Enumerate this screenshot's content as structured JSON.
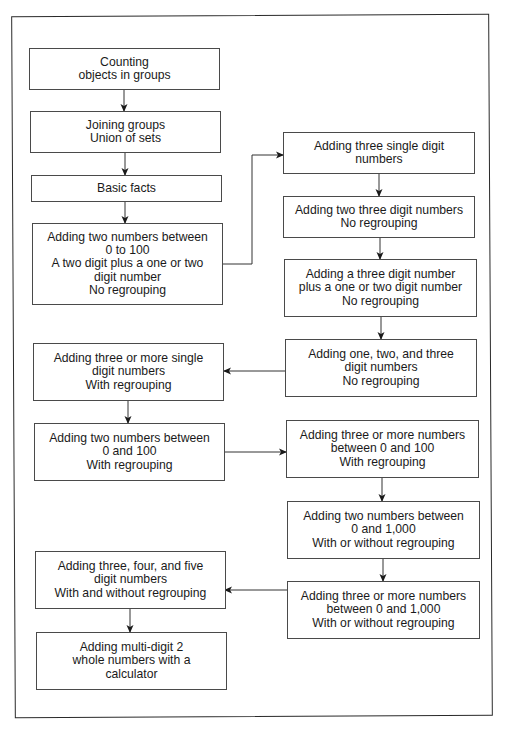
{
  "diagram": {
    "type": "flowchart",
    "title": "",
    "left_column": [
      {
        "id": "counting",
        "lines": [
          "Counting",
          "objects in groups"
        ]
      },
      {
        "id": "joining",
        "lines": [
          "Joining groups",
          "Union of sets"
        ]
      },
      {
        "id": "basic-facts",
        "lines": [
          "Basic facts"
        ]
      },
      {
        "id": "two-numbers-0-100-no-regroup",
        "lines": [
          "Adding two numbers between",
          "0 to 100",
          "A two digit plus a one or two",
          "digit number",
          "No regrouping"
        ]
      },
      {
        "id": "three-or-more-single-regroup",
        "lines": [
          "Adding three or more single",
          "digit numbers",
          "With regrouping"
        ]
      },
      {
        "id": "two-numbers-0-100-regroup",
        "lines": [
          "Adding two numbers between",
          "0 and 100",
          "With regrouping"
        ]
      },
      {
        "id": "three-four-five-digit",
        "lines": [
          "Adding three, four, and five",
          "digit numbers",
          "With and without regrouping"
        ]
      },
      {
        "id": "calculator",
        "lines": [
          "Adding multi-digit 2",
          "whole numbers with a",
          "calculator"
        ]
      }
    ],
    "right_column": [
      {
        "id": "three-single-digit",
        "lines": [
          "Adding three single digit",
          "numbers"
        ]
      },
      {
        "id": "two-three-digit",
        "lines": [
          "Adding two three digit numbers",
          "No regrouping"
        ]
      },
      {
        "id": "three-digit-plus-one-two",
        "lines": [
          "Adding a three digit number",
          "plus a one or two digit number",
          "No regrouping"
        ]
      },
      {
        "id": "one-two-three-digit",
        "lines": [
          "Adding one, two, and three",
          "digit numbers",
          "No regrouping"
        ]
      },
      {
        "id": "three-or-more-0-100",
        "lines": [
          "Adding three or more numbers",
          "between 0 and 100",
          "With regrouping"
        ]
      },
      {
        "id": "two-numbers-0-1000",
        "lines": [
          "Adding two numbers between",
          "0 and 1,000",
          "With or without regrouping"
        ]
      },
      {
        "id": "three-or-more-0-1000",
        "lines": [
          "Adding three or more numbers",
          "between 0 and 1,000",
          "With or without regrouping"
        ]
      }
    ],
    "edges": [
      [
        "counting",
        "joining"
      ],
      [
        "joining",
        "basic-facts"
      ],
      [
        "basic-facts",
        "two-numbers-0-100-no-regroup"
      ],
      [
        "two-numbers-0-100-no-regroup",
        "three-single-digit"
      ],
      [
        "three-single-digit",
        "two-three-digit"
      ],
      [
        "two-three-digit",
        "three-digit-plus-one-two"
      ],
      [
        "three-digit-plus-one-two",
        "one-two-three-digit"
      ],
      [
        "one-two-three-digit",
        "three-or-more-single-regroup"
      ],
      [
        "three-or-more-single-regroup",
        "two-numbers-0-100-regroup"
      ],
      [
        "two-numbers-0-100-regroup",
        "three-or-more-0-100"
      ],
      [
        "three-or-more-0-100",
        "two-numbers-0-1000"
      ],
      [
        "two-numbers-0-1000",
        "three-or-more-0-1000"
      ],
      [
        "three-or-more-0-1000",
        "three-four-five-digit"
      ],
      [
        "three-four-five-digit",
        "calculator"
      ]
    ]
  }
}
